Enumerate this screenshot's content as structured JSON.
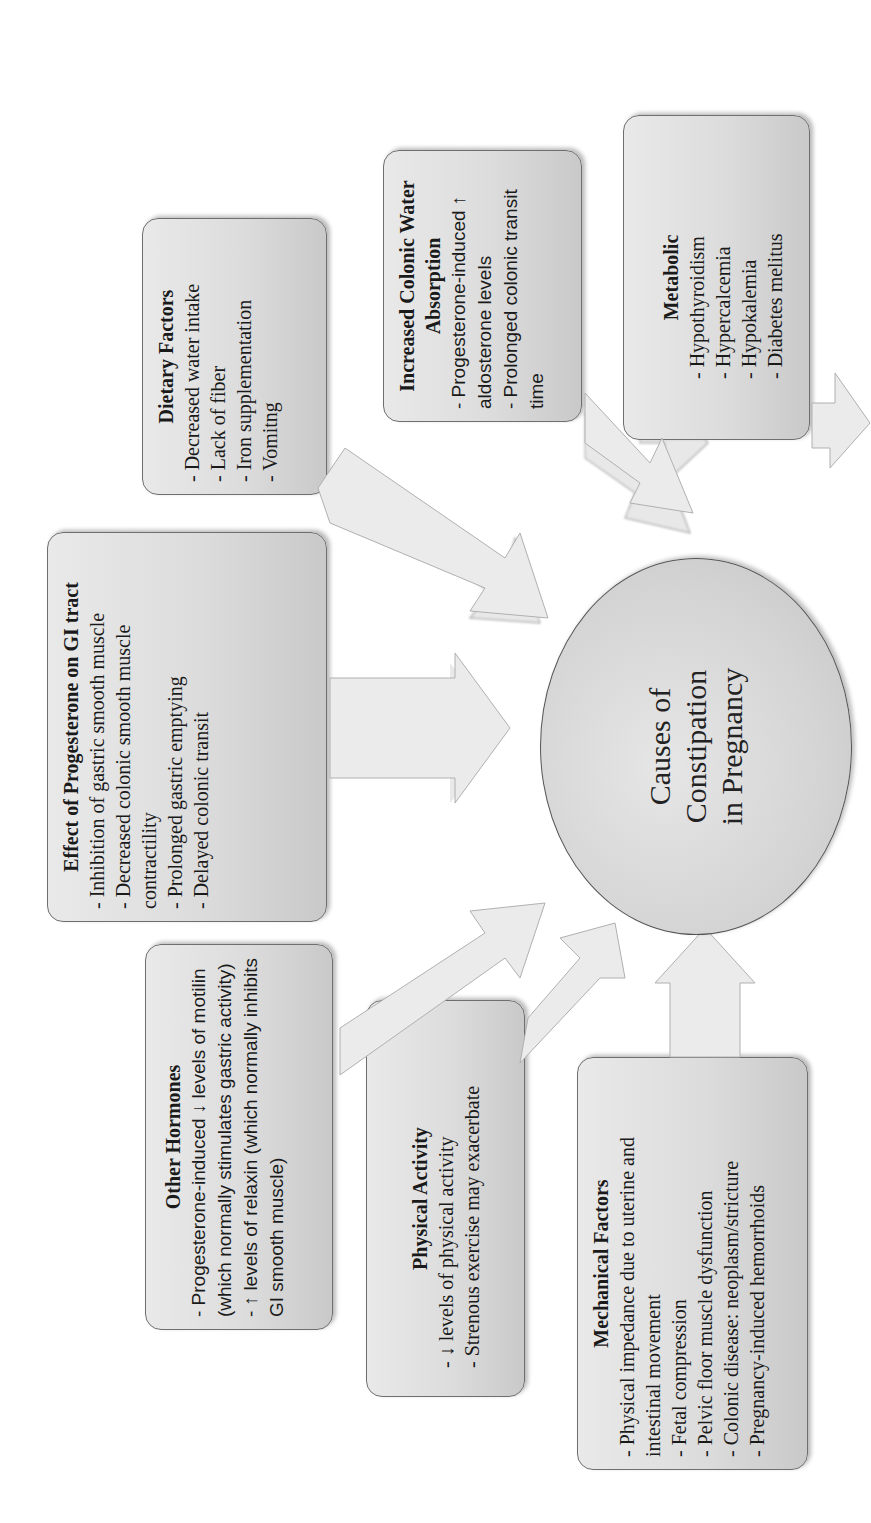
{
  "diagram": {
    "center": {
      "lines": [
        "Causes of",
        "Constipation",
        "in Pregnancy"
      ]
    },
    "boxes": {
      "progesterone": {
        "title": "Effect of Progesterone on GI tract",
        "items": [
          "- Inhibition of gastric smooth muscle",
          "- Decreased colonic smooth muscle contractility",
          "- Prolonged gastric emptying",
          "- Delayed colonic transit"
        ]
      },
      "dietary": {
        "title": "Dietary Factors",
        "items": [
          "- Decreased water intake",
          "- Lack of fiber",
          "- Iron supplementation",
          "- Vomitng"
        ]
      },
      "colonic": {
        "title": "Increased Colonic Water Absorption",
        "items": [
          "- Progesterone-induced ↑ aldosterone levels",
          "- Prolonged colonic transit time"
        ]
      },
      "metabolic": {
        "title": "Metabolic",
        "items": [
          "- Hypothyroidism",
          "- Hypercalcemia",
          "- Hypokalemia",
          "- Diabetes melitus"
        ]
      },
      "hormones": {
        "title": "Other Hormones",
        "items": [
          "- Progesterone-induced ↓ levels of motilin (which normally stimulates gastric activity)",
          "- ↑ levels of relaxin (which normally inhibits GI smooth muscle)"
        ]
      },
      "physical": {
        "title": "Physical Activity",
        "items": [
          "- ↓ levels of physical activity",
          "- Strenous exercise may exacerbate"
        ]
      },
      "mechanical": {
        "title": "Mechanical Factors",
        "items": [
          "- Physical impedance due to uterine and intestinal movement",
          "- Fetal compression",
          "- Pelvic floor muscle dysfunction",
          "- Colonic disease: neoplasm/stricture",
          "- Pregnancy-induced hemorrhoids"
        ]
      }
    },
    "colors": {
      "box_fill": "#dcdcdc",
      "box_border": "#6f6f6f",
      "arrow_fill": "#e8e8e8",
      "arrow_edge": "#9a9a9a",
      "text": "#1a1a1a"
    }
  }
}
